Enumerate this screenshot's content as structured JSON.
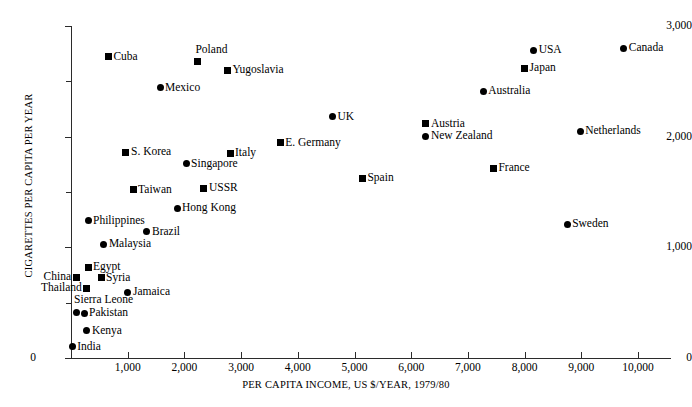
{
  "chart_data": {
    "type": "scatter",
    "title": "",
    "xlabel": "PER CAPITA INCOME, US $/YEAR, 1979/80",
    "ylabel": "CIGARETTES PER CAPITA PER YEAR",
    "xlim": [
      0,
      10550
    ],
    "ylim": [
      0,
      3000
    ],
    "grid": false,
    "legend": "none",
    "xticks": [
      "0",
      "1,000",
      "2,000",
      "3,000",
      "4,000",
      "5,000",
      "6,000",
      "7,000",
      "8,000",
      "9,000",
      "10,000"
    ],
    "xtick_values": [
      0,
      1000,
      2000,
      3000,
      4000,
      5000,
      6000,
      7000,
      8000,
      9000,
      10000
    ],
    "yticks": [
      "0",
      "1,000",
      "2,000",
      "3,000"
    ],
    "ytick_values": [
      0,
      1000,
      2000,
      3000
    ],
    "yticks_minor": [
      500,
      1500,
      2500
    ],
    "marker_note": "Two marker shapes are used: filled circle and filled square; no legend is shown.",
    "points": [
      {
        "label": "Cuba",
        "x": 660,
        "y": 2720,
        "marker": "square",
        "label_pos": "right"
      },
      {
        "label": "Poland",
        "x": 2230,
        "y": 2675,
        "marker": "square",
        "label_pos": "above"
      },
      {
        "label": "Yugoslavia",
        "x": 2760,
        "y": 2600,
        "marker": "square",
        "label_pos": "right"
      },
      {
        "label": "Mexico",
        "x": 1570,
        "y": 2440,
        "marker": "circle",
        "label_pos": "right"
      },
      {
        "label": "USA",
        "x": 8160,
        "y": 2780,
        "marker": "circle",
        "label_pos": "right"
      },
      {
        "label": "Canada",
        "x": 9750,
        "y": 2800,
        "marker": "circle",
        "label_pos": "right"
      },
      {
        "label": "Japan",
        "x": 8000,
        "y": 2620,
        "marker": "square",
        "label_pos": "right"
      },
      {
        "label": "Australia",
        "x": 7270,
        "y": 2410,
        "marker": "circle",
        "label_pos": "right"
      },
      {
        "label": "UK",
        "x": 4610,
        "y": 2180,
        "marker": "circle",
        "label_pos": "right"
      },
      {
        "label": "Austria",
        "x": 6260,
        "y": 2115,
        "marker": "square",
        "label_pos": "right"
      },
      {
        "label": "New Zealand",
        "x": 6260,
        "y": 2005,
        "marker": "circle",
        "label_pos": "right"
      },
      {
        "label": "Netherlands",
        "x": 8980,
        "y": 2050,
        "marker": "circle",
        "label_pos": "right"
      },
      {
        "label": "E. Germany",
        "x": 3690,
        "y": 1945,
        "marker": "square",
        "label_pos": "right"
      },
      {
        "label": "S. Korea",
        "x": 970,
        "y": 1860,
        "marker": "square",
        "label_pos": "right"
      },
      {
        "label": "Italy",
        "x": 2805,
        "y": 1850,
        "marker": "square",
        "label_pos": "right"
      },
      {
        "label": "Singapore",
        "x": 2030,
        "y": 1755,
        "marker": "circle",
        "label_pos": "right"
      },
      {
        "label": "France",
        "x": 7450,
        "y": 1715,
        "marker": "square",
        "label_pos": "right"
      },
      {
        "label": "Spain",
        "x": 5140,
        "y": 1625,
        "marker": "square",
        "label_pos": "right"
      },
      {
        "label": "USSR",
        "x": 2345,
        "y": 1535,
        "marker": "square",
        "label_pos": "right"
      },
      {
        "label": "Taiwan",
        "x": 1095,
        "y": 1520,
        "marker": "square",
        "label_pos": "right"
      },
      {
        "label": "Hong Kong",
        "x": 1870,
        "y": 1355,
        "marker": "circle",
        "label_pos": "right"
      },
      {
        "label": "Sweden",
        "x": 8750,
        "y": 1210,
        "marker": "circle",
        "label_pos": "right"
      },
      {
        "label": "Philippines",
        "x": 300,
        "y": 1240,
        "marker": "circle",
        "label_pos": "right"
      },
      {
        "label": "Brazil",
        "x": 1340,
        "y": 1140,
        "marker": "circle",
        "label_pos": "right"
      },
      {
        "label": "Malaysia",
        "x": 580,
        "y": 1030,
        "marker": "circle",
        "label_pos": "right"
      },
      {
        "label": "Egypt",
        "x": 300,
        "y": 820,
        "marker": "square",
        "label_pos": "right"
      },
      {
        "label": "China",
        "x": 90,
        "y": 730,
        "marker": "square",
        "label_pos": "left"
      },
      {
        "label": "Syria",
        "x": 530,
        "y": 725,
        "marker": "square",
        "label_pos": "right"
      },
      {
        "label": "Thailand",
        "x": 280,
        "y": 630,
        "marker": "square",
        "label_pos": "left"
      },
      {
        "label": "Jamaica",
        "x": 1005,
        "y": 595,
        "marker": "circle",
        "label_pos": "right"
      },
      {
        "label": "Sierra Leone",
        "x": 90,
        "y": 415,
        "marker": "circle",
        "label_pos": "above"
      },
      {
        "label": "Pakistan",
        "x": 230,
        "y": 405,
        "marker": "circle",
        "label_pos": "right"
      },
      {
        "label": "Kenya",
        "x": 280,
        "y": 245,
        "marker": "circle",
        "label_pos": "right"
      },
      {
        "label": "India",
        "x": 20,
        "y": 100,
        "marker": "circle",
        "label_pos": "right"
      }
    ]
  }
}
